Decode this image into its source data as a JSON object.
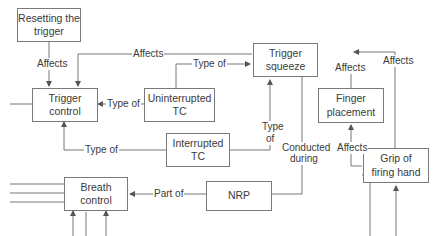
{
  "diagram": {
    "nodes": [
      {
        "id": "resetting",
        "label": "Resetting the trigger"
      },
      {
        "id": "trigger_control",
        "label": "Trigger control"
      },
      {
        "id": "uninterrupted_tc",
        "label": "Uninterrupted TC"
      },
      {
        "id": "trigger_squeeze",
        "label": "Trigger squeeze"
      },
      {
        "id": "finger_placement",
        "label": "Finger placement"
      },
      {
        "id": "interrupted_tc",
        "label": "Interrupted TC"
      },
      {
        "id": "grip",
        "label": "Grip of firing hand"
      },
      {
        "id": "breath_control",
        "label": "Breath control"
      },
      {
        "id": "nrp",
        "label": "NRP"
      }
    ],
    "edges": [
      {
        "from": "resetting",
        "to": "trigger_control",
        "label": "Affects"
      },
      {
        "from": "trigger_squeeze",
        "to": "trigger_control",
        "label": "Affects"
      },
      {
        "from": "uninterrupted_tc",
        "to": "trigger_squeeze",
        "label": "Type of"
      },
      {
        "from": "uninterrupted_tc",
        "to": "trigger_control",
        "label": "Type of"
      },
      {
        "from": "interrupted_tc",
        "to": "trigger_control",
        "label": "Type of"
      },
      {
        "from": "interrupted_tc",
        "to": "trigger_squeeze",
        "label": "Type of"
      },
      {
        "from": "finger_placement",
        "to": "trigger_squeeze",
        "label": "Affects"
      },
      {
        "from": "grip",
        "to": "trigger_squeeze",
        "label": "Affects"
      },
      {
        "from": "grip",
        "to": "finger_placement",
        "label": "Affects"
      },
      {
        "from": "trigger_squeeze",
        "to": "nrp",
        "label": "Conducted during"
      },
      {
        "from": "nrp",
        "to": "breath_control",
        "label": "Part of"
      }
    ],
    "labels": {
      "affects": "Affects",
      "type_of": "Type of",
      "type": "Type",
      "of": "of",
      "conducted": "Conducted",
      "during": "during",
      "part_of": "Part of"
    },
    "node_lines": {
      "resetting_1": "Resetting the",
      "resetting_2": "trigger",
      "finger_1": "Finger",
      "finger_2": "placement",
      "grip_1": "Grip of",
      "grip_2": "firing hand"
    }
  }
}
